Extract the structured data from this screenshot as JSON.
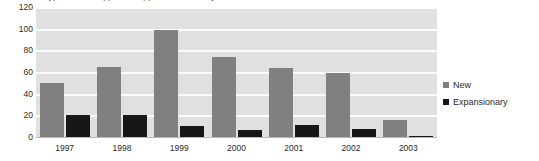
{
  "chart_data": {
    "type": "bar",
    "title": "Types of loan approvals approved over the year",
    "title_clipped": true,
    "xlabel": "",
    "ylabel": "",
    "categories": [
      "1997",
      "1998",
      "1999",
      "2000",
      "2001",
      "2002",
      "2003"
    ],
    "series": [
      {
        "name": "New",
        "color": "#808080",
        "values": [
          51,
          66,
          100,
          75,
          65,
          60,
          17
        ]
      },
      {
        "name": "Expansionary",
        "color": "#171717",
        "values": [
          21,
          21,
          11,
          7,
          12,
          8,
          2
        ]
      }
    ],
    "ylim": [
      0,
      120
    ],
    "ytick_labels": [
      "120",
      "100",
      "80",
      "60",
      "40",
      "20",
      "0"
    ],
    "ytick_values": [
      120,
      100,
      80,
      60,
      40,
      20,
      0
    ],
    "grid": true,
    "grid_color": "#fbfbfb",
    "plot_background": "#e0e0e0",
    "legend_position": "right"
  },
  "legend": {
    "items": [
      {
        "label": "New",
        "swatch": "new"
      },
      {
        "label": "Expansionary",
        "swatch": "exp"
      }
    ]
  }
}
